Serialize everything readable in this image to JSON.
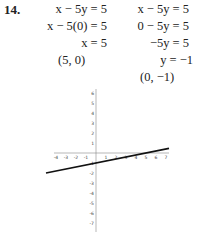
{
  "problem_number": "14.",
  "column_a": [
    {
      "text": "x − 5y = 5",
      "align": "right"
    },
    {
      "text": "x − 5(0) = 5",
      "align": "right"
    },
    {
      "text": "x = 5",
      "align": "right"
    },
    {
      "text": "(5, 0)",
      "align": "center"
    }
  ],
  "column_b": [
    {
      "text": "x − 5y = 5"
    },
    {
      "text": "0 − 5y = 5"
    },
    {
      "text": "−5y = 5"
    },
    {
      "text": "y = −1"
    },
    {
      "text": "(0, −1)"
    }
  ],
  "graph": {
    "x_ticks": [
      "-4",
      "-3",
      "-2",
      "-1",
      "1",
      "2",
      "3",
      "4",
      "5",
      "6",
      "7"
    ],
    "y_ticks_pos": [
      "6",
      "5",
      "4",
      "3",
      "2",
      "1"
    ],
    "y_ticks_neg": [
      "-1",
      "-2",
      "-3",
      "-4",
      "-5",
      "-6",
      "-7"
    ],
    "line": {
      "equation": "x - 5y = 5",
      "x_intercept": [
        5,
        0
      ],
      "y_intercept": [
        0,
        -1
      ]
    }
  }
}
